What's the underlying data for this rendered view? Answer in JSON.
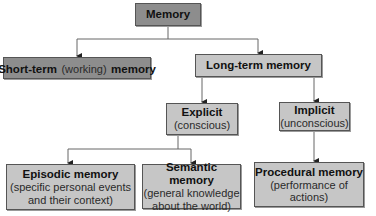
{
  "diagram": {
    "title": "Memory",
    "nodes": {
      "memory": {
        "title": "Memory"
      },
      "short_term": {
        "title_bold_1": "Short-term",
        "title_normal": "(working)",
        "title_bold_2": "memory"
      },
      "long_term": {
        "title": "Long-term memory"
      },
      "explicit": {
        "title": "Explicit",
        "subtitle": "(conscious)"
      },
      "implicit": {
        "title": "Implicit",
        "subtitle": "(unconscious)"
      },
      "episodic": {
        "title": "Episodic memory",
        "subtitle_line1": "(specific personal events",
        "subtitle_line2": "and their context)"
      },
      "semantic": {
        "title": "Semantic memory",
        "subtitle_line1": "(general knowledge",
        "subtitle_line2": "about the world)"
      },
      "procedural": {
        "title": "Procedural memory",
        "subtitle_line1": "(performance of",
        "subtitle_line2": "actions)"
      }
    },
    "edges": [
      [
        "Memory",
        "Short-term (working) memory"
      ],
      [
        "Memory",
        "Long-term memory"
      ],
      [
        "Long-term memory",
        "Explicit"
      ],
      [
        "Long-term memory",
        "Implicit"
      ],
      [
        "Explicit",
        "Episodic memory"
      ],
      [
        "Explicit",
        "Semantic memory"
      ],
      [
        "Implicit",
        "Procedural memory"
      ]
    ],
    "colors": {
      "dark_box": "#8d8d8d",
      "light_box": "#c6c6c6",
      "line": "#555555"
    }
  }
}
